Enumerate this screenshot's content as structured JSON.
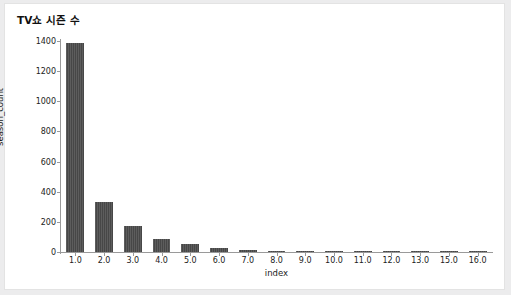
{
  "chart_data": {
    "type": "bar",
    "title": "TV쇼 시즌 수",
    "xlabel": "index",
    "ylabel": "season_count",
    "categories": [
      "1.0",
      "2.0",
      "3.0",
      "4.0",
      "5.0",
      "6.0",
      "7.0",
      "8.0",
      "9.0",
      "10.0",
      "11.0",
      "12.0",
      "13.0",
      "15.0",
      "16.0"
    ],
    "values": [
      1390,
      335,
      172,
      86,
      55,
      28,
      14,
      10,
      5,
      4,
      3,
      2,
      2,
      1,
      1
    ],
    "ylim": [
      0,
      1400
    ],
    "yticks": [
      0,
      200,
      400,
      600,
      800,
      1000,
      1200,
      1400
    ],
    "ytick_labels": [
      "0",
      "200",
      "400",
      "600",
      "800",
      "1000",
      "1200",
      "1400"
    ],
    "grid": false,
    "legend": null,
    "bar_color": "#4b4b4b"
  },
  "figure": {
    "background_color": "#ffffff",
    "outer_background_color": "#ececed",
    "border_color": "#e3e3e3",
    "axis_color": "#9a9a9a"
  }
}
